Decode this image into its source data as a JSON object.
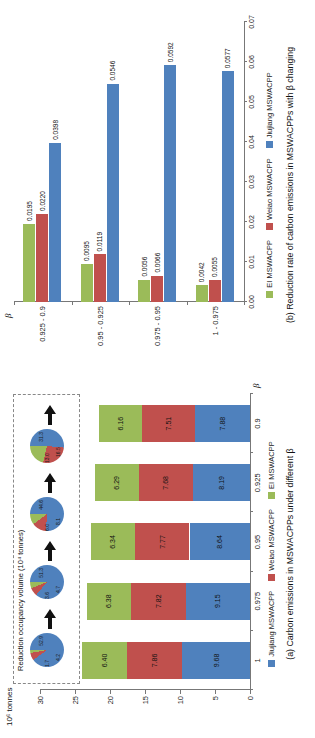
{
  "figure_colors": {
    "jiujiang_blue": "#4F81BD",
    "weiao_red": "#C0504D",
    "ei_green": "#9BBB59",
    "arrow_black": "#111111"
  },
  "chart_data": [
    {
      "id": "a",
      "type": "bar",
      "subtype": "stacked-vertical",
      "title": "(a) Carbon emissions in MSWACPPs under different β",
      "ylabel": "10⁶ tonnes",
      "xlabel": "β",
      "ylim": [
        0,
        30
      ],
      "y_ticks": [
        0,
        5,
        10,
        15,
        20,
        25,
        30
      ],
      "grid": false,
      "legend_position": "bottom",
      "categories": [
        "1",
        "0.975",
        "0.95",
        "0.925",
        "0.9"
      ],
      "series": [
        {
          "name": "Jiujiang MSWACPP",
          "color": "#4F81BD",
          "values": [
            9.68,
            9.15,
            8.64,
            8.19,
            7.88
          ]
        },
        {
          "name": "Weiao MSWACPP",
          "color": "#C0504D",
          "values": [
            7.86,
            7.82,
            7.77,
            7.68,
            7.51
          ]
        },
        {
          "name": "EI MSWACPP",
          "color": "#9BBB59",
          "values": [
            6.4,
            6.38,
            6.34,
            6.29,
            6.16
          ]
        }
      ],
      "inset": {
        "title": "Reduction occupancy volume (10⁴ tonnes)",
        "type": "pie-sequence",
        "pies": [
          {
            "slices": [
              {
                "name": "Jiujiang MSWACPP",
                "color": "#4F81BD",
                "value": 52.9
              },
              {
                "name": "Weiao MSWACPP",
                "color": "#C0504D",
                "value": 4.2
              },
              {
                "name": "EI MSWACPP",
                "color": "#9BBB59",
                "value": 1.7
              }
            ]
          },
          {
            "slices": [
              {
                "name": "Jiujiang MSWACPP",
                "color": "#4F81BD",
                "value": 51.3
              },
              {
                "name": "Weiao MSWACPP",
                "color": "#C0504D",
                "value": 4.7
              },
              {
                "name": "EI MSWACPP",
                "color": "#9BBB59",
                "value": 3.6
              }
            ]
          },
          {
            "slices": [
              {
                "name": "Jiujiang MSWACPP",
                "color": "#4F81BD",
                "value": 44.6
              },
              {
                "name": "Weiao MSWACPP",
                "color": "#C0504D",
                "value": 8.1
              },
              {
                "name": "EI MSWACPP",
                "color": "#9BBB59",
                "value": 6.0
              }
            ]
          },
          {
            "slices": [
              {
                "name": "Jiujiang MSWACPP",
                "color": "#4F81BD",
                "value": 31.3
              },
              {
                "name": "Weiao MSWACPP",
                "color": "#C0504D",
                "value": 16.5
              },
              {
                "name": "EI MSWACPP",
                "color": "#9BBB59",
                "value": 13.0
              }
            ]
          }
        ]
      }
    },
    {
      "id": "b",
      "type": "bar",
      "subtype": "grouped-horizontal",
      "title": "(b) Reduction rate of carbon emissions in MSWACPPs with β changing",
      "axis_symbol": "β",
      "xlim": [
        0,
        0.07
      ],
      "x_ticks": [
        "0.00",
        "0.01",
        "0.02",
        "0.03",
        "0.04",
        "0.05",
        "0.06",
        "0.07"
      ],
      "grid": false,
      "legend_position": "bottom",
      "categories": [
        "0.925 - 0.9",
        "0.95 - 0.925",
        "0.975 - 0.95",
        "1 - 0.975"
      ],
      "series": [
        {
          "name": "EI MSWACPP",
          "color": "#9BBB59",
          "values": [
            0.0195,
            0.0095,
            0.0056,
            0.0042
          ]
        },
        {
          "name": "Weiao MSWACPP",
          "color": "#C0504D",
          "values": [
            0.022,
            0.0119,
            0.0066,
            0.0055
          ]
        },
        {
          "name": "Jiujiang MSWACPP",
          "color": "#4F81BD",
          "values": [
            0.0398,
            0.0546,
            0.0592,
            0.0577
          ]
        }
      ]
    }
  ]
}
